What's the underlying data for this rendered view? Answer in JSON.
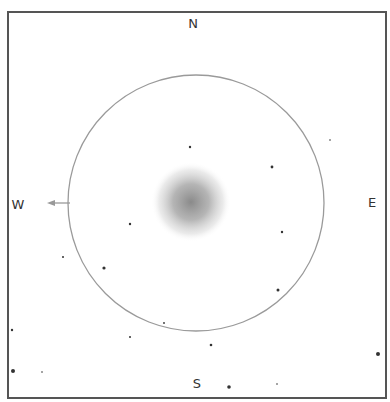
{
  "chart": {
    "labels": {
      "north": "N",
      "south": "S",
      "west": "W",
      "east": "E"
    },
    "field_of_view": {
      "cx": 196,
      "cy": 203,
      "r": 128,
      "stroke": "#9a9a9a"
    },
    "object": {
      "cx": 191,
      "cy": 202,
      "r": 40,
      "color": "#8c8c8c"
    },
    "motion_arrow": {
      "x1": 70,
      "y1": 203,
      "x2": 47,
      "y2": 203,
      "color": "#999999"
    },
    "stars": [
      {
        "x": 190,
        "y": 147,
        "r": 1.2
      },
      {
        "x": 272,
        "y": 167,
        "r": 1.4
      },
      {
        "x": 330,
        "y": 140,
        "r": 0.8
      },
      {
        "x": 282,
        "y": 232,
        "r": 1.2
      },
      {
        "x": 278,
        "y": 290,
        "r": 1.5
      },
      {
        "x": 130,
        "y": 224,
        "r": 1.2
      },
      {
        "x": 63,
        "y": 257,
        "r": 1.0
      },
      {
        "x": 104,
        "y": 268,
        "r": 1.6
      },
      {
        "x": 164,
        "y": 323,
        "r": 0.9
      },
      {
        "x": 130,
        "y": 337,
        "r": 1.0
      },
      {
        "x": 211,
        "y": 345,
        "r": 1.3
      },
      {
        "x": 378,
        "y": 354,
        "r": 2.0
      },
      {
        "x": 12,
        "y": 330,
        "r": 1.2
      },
      {
        "x": 13,
        "y": 371,
        "r": 2.0
      },
      {
        "x": 42,
        "y": 372,
        "r": 0.8
      },
      {
        "x": 229,
        "y": 387,
        "r": 1.8
      },
      {
        "x": 277,
        "y": 384,
        "r": 0.8
      }
    ]
  }
}
